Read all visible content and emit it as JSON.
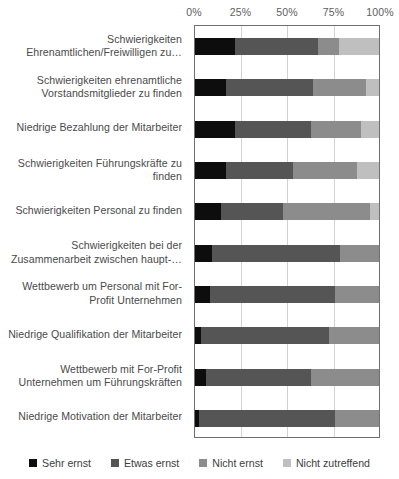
{
  "chart_data": {
    "type": "bar",
    "orientation": "horizontal",
    "stacked": true,
    "normalized": "100%",
    "title": "",
    "xlabel": "",
    "ylabel": "",
    "xlim": [
      0,
      100
    ],
    "grid": true,
    "legend_position": "bottom",
    "tick_labels": [
      "0%",
      "25%",
      "50%",
      "75%",
      "100%"
    ],
    "tick_values": [
      0,
      25,
      50,
      75,
      100
    ],
    "categories": [
      "Schwierigkeiten Ehrenamtlichen/Freiwilligen zu…",
      "Schwierigkeiten ehrenamtliche Vorstandsmitglieder zu finden",
      "Niedrige Bezahlung der Mitarbeiter",
      "Schwierigkeiten Führungskräfte zu finden",
      "Schwierigkeiten Personal zu finden",
      "Schwierigkeiten bei der Zusammenarbeit zwischen haupt-…",
      "Wettbewerb um Personal mit For-Profit Unternehmen",
      "Niedrige Qualifikation der Mitarbeiter",
      "Wettbewerb mit For-Profit Unternehmen um Führungskräften",
      "Niedrige Motivation der Mitarbeiter"
    ],
    "series": [
      {
        "name": "Sehr ernst",
        "color": "#0d0d0d",
        "values": [
          22,
          17,
          22,
          17,
          14,
          9,
          8,
          3,
          6,
          2
        ]
      },
      {
        "name": "Etwas ernst",
        "color": "#555555",
        "values": [
          45,
          47,
          41,
          36,
          34,
          70,
          68,
          70,
          57,
          74
        ]
      },
      {
        "name": "Nicht ernst",
        "color": "#8c8c8c",
        "values": [
          11,
          29,
          27,
          35,
          47,
          21,
          24,
          27,
          37,
          24
        ]
      },
      {
        "name": "Nicht zutreffend",
        "color": "#bfbfbf",
        "values": [
          22,
          7,
          10,
          12,
          5,
          0,
          0,
          0,
          0,
          0
        ]
      }
    ]
  },
  "legend": {
    "items": [
      {
        "label": "Sehr ernst",
        "color": "#0d0d0d"
      },
      {
        "label": "Etwas ernst",
        "color": "#555555"
      },
      {
        "label": "Nicht ernst",
        "color": "#8c8c8c"
      },
      {
        "label": "Nicht zutreffend",
        "color": "#bfbfbf"
      }
    ]
  },
  "colors": {
    "plot_border": "#6f6f6f",
    "gridline": "#d2d2d2",
    "background": "#ffffff",
    "text": "#4a4a4a"
  }
}
